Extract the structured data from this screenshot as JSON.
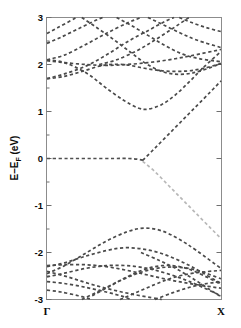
{
  "chart_data": {
    "type": "line",
    "title": "",
    "subtitle": "",
    "xlabel": "",
    "ylabel": "E-E_F (eV)",
    "ylabel_main": "E–E",
    "ylabel_sub": "F",
    "ylabel_unit": " (eV)",
    "xlim": [
      0,
      1
    ],
    "ylim": [
      -3,
      3
    ],
    "grid": false,
    "legend": null,
    "linestyle": "dashed",
    "x_tick_labels": [
      "Γ",
      "X"
    ],
    "x_tick_values": [
      0,
      1
    ],
    "y_tick_labels": [
      "3",
      "2",
      "1",
      "0",
      "-1",
      "-2",
      "-3"
    ],
    "y_tick_values": [
      3,
      2,
      1,
      0,
      -1,
      -2,
      -3
    ],
    "y_minor_ticks": [
      2.5,
      1.5,
      0.5,
      -0.5,
      -1.5,
      -2.5
    ],
    "colors": {
      "band_dark": "#4a4a4a",
      "band_faint": "#b8b8b8",
      "frame": "#8c8c8c",
      "text": "#0a0a0a",
      "background": "#ffffff"
    },
    "series": [
      {
        "name": "flat-zero-band",
        "style": "dashed-dark",
        "points": [
          [
            0.0,
            0.0
          ],
          [
            0.12,
            0.0
          ],
          [
            0.25,
            0.0
          ],
          [
            0.38,
            0.0
          ],
          [
            0.47,
            0.0
          ],
          [
            0.53,
            -0.02
          ],
          [
            0.56,
            -0.05
          ]
        ]
      },
      {
        "name": "conduction-linear-up",
        "style": "dashed-dark",
        "points": [
          [
            0.55,
            -0.04
          ],
          [
            0.62,
            0.22
          ],
          [
            0.7,
            0.52
          ],
          [
            0.78,
            0.82
          ],
          [
            0.86,
            1.12
          ],
          [
            0.94,
            1.42
          ],
          [
            1.0,
            1.65
          ]
        ]
      },
      {
        "name": "valence-linear-down-faint",
        "style": "dashed-faint",
        "points": [
          [
            0.55,
            -0.06
          ],
          [
            0.62,
            -0.28
          ],
          [
            0.7,
            -0.58
          ],
          [
            0.78,
            -0.88
          ],
          [
            0.86,
            -1.18
          ],
          [
            0.94,
            -1.48
          ],
          [
            1.0,
            -1.7
          ]
        ]
      },
      {
        "name": "cb-dip-band",
        "style": "dashed-dark",
        "points": [
          [
            0.0,
            2.1
          ],
          [
            0.08,
            2.06
          ],
          [
            0.16,
            1.95
          ],
          [
            0.25,
            1.76
          ],
          [
            0.34,
            1.5
          ],
          [
            0.44,
            1.24
          ],
          [
            0.52,
            1.08
          ],
          [
            0.58,
            1.05
          ],
          [
            0.66,
            1.15
          ],
          [
            0.74,
            1.36
          ],
          [
            0.82,
            1.64
          ],
          [
            0.9,
            1.94
          ],
          [
            1.0,
            2.28
          ]
        ]
      },
      {
        "name": "cb-band-2",
        "style": "dashed-dark",
        "points": [
          [
            0.0,
            1.7
          ],
          [
            0.09,
            1.74
          ],
          [
            0.2,
            1.85
          ],
          [
            0.32,
            1.98
          ],
          [
            0.44,
            2.0
          ],
          [
            0.56,
            1.92
          ],
          [
            0.68,
            1.86
          ],
          [
            0.8,
            1.86
          ],
          [
            0.9,
            1.92
          ],
          [
            1.0,
            2.02
          ]
        ]
      },
      {
        "name": "cb-band-3",
        "style": "dashed-dark",
        "points": [
          [
            0.0,
            1.7
          ],
          [
            0.1,
            1.8
          ],
          [
            0.22,
            1.96
          ],
          [
            0.34,
            2.2
          ],
          [
            0.46,
            2.48
          ],
          [
            0.58,
            2.72
          ],
          [
            0.68,
            2.92
          ],
          [
            0.73,
            3.0
          ]
        ]
      },
      {
        "name": "cb-band-4",
        "style": "dashed-dark",
        "points": [
          [
            0.0,
            2.1
          ],
          [
            0.1,
            2.2
          ],
          [
            0.22,
            2.42
          ],
          [
            0.34,
            2.66
          ],
          [
            0.46,
            2.88
          ],
          [
            0.54,
            3.0
          ]
        ]
      },
      {
        "name": "cb-band-5",
        "style": "dashed-dark",
        "points": [
          [
            0.0,
            2.45
          ],
          [
            0.08,
            2.58
          ],
          [
            0.18,
            2.76
          ],
          [
            0.28,
            2.94
          ],
          [
            0.32,
            3.0
          ]
        ]
      },
      {
        "name": "cb-band-6",
        "style": "dashed-dark",
        "points": [
          [
            0.0,
            2.66
          ],
          [
            0.06,
            2.78
          ],
          [
            0.14,
            2.94
          ],
          [
            0.17,
            3.0
          ]
        ]
      },
      {
        "name": "cb-band-7-desc",
        "style": "dashed-dark",
        "points": [
          [
            0.2,
            3.0
          ],
          [
            0.28,
            2.8
          ],
          [
            0.38,
            2.54
          ],
          [
            0.48,
            2.26
          ],
          [
            0.56,
            2.04
          ],
          [
            0.64,
            1.88
          ],
          [
            0.72,
            1.8
          ],
          [
            0.8,
            1.8
          ],
          [
            0.88,
            1.86
          ],
          [
            1.0,
            2.02
          ]
        ]
      },
      {
        "name": "cb-band-8-desc",
        "style": "dashed-dark",
        "points": [
          [
            0.4,
            3.0
          ],
          [
            0.48,
            2.84
          ],
          [
            0.58,
            2.62
          ],
          [
            0.68,
            2.4
          ],
          [
            0.78,
            2.22
          ],
          [
            0.88,
            2.12
          ],
          [
            1.0,
            2.06
          ]
        ]
      },
      {
        "name": "cb-band-9-desc",
        "style": "dashed-dark",
        "points": [
          [
            0.58,
            3.0
          ],
          [
            0.66,
            2.86
          ],
          [
            0.76,
            2.68
          ],
          [
            0.86,
            2.52
          ],
          [
            1.0,
            2.36
          ]
        ]
      },
      {
        "name": "cb-band-10-desc",
        "style": "dashed-dark",
        "points": [
          [
            0.76,
            3.0
          ],
          [
            0.84,
            2.88
          ],
          [
            0.92,
            2.78
          ],
          [
            1.0,
            2.7
          ]
        ]
      },
      {
        "name": "cb-band-11-cross",
        "style": "dashed-dark",
        "points": [
          [
            0.3,
            2.0
          ],
          [
            0.4,
            2.1
          ],
          [
            0.52,
            2.3
          ],
          [
            0.62,
            2.52
          ],
          [
            0.72,
            2.76
          ],
          [
            0.8,
            2.96
          ],
          [
            0.82,
            3.0
          ]
        ]
      },
      {
        "name": "cb-band-12-flat",
        "style": "dashed-dark",
        "points": [
          [
            0.0,
            2.08
          ],
          [
            0.1,
            2.04
          ],
          [
            0.22,
            2.0
          ],
          [
            0.34,
            1.98
          ],
          [
            0.46,
            2.0
          ],
          [
            0.58,
            2.04
          ],
          [
            0.7,
            2.1
          ],
          [
            0.82,
            2.18
          ],
          [
            1.0,
            2.32
          ]
        ]
      },
      {
        "name": "vb-band-1-top",
        "style": "dashed-dark",
        "points": [
          [
            0.0,
            -2.45
          ],
          [
            0.1,
            -2.28
          ],
          [
            0.22,
            -2.02
          ],
          [
            0.34,
            -1.76
          ],
          [
            0.46,
            -1.56
          ],
          [
            0.56,
            -1.48
          ],
          [
            0.66,
            -1.54
          ],
          [
            0.76,
            -1.72
          ],
          [
            0.86,
            -1.96
          ],
          [
            1.0,
            -2.34
          ]
        ]
      },
      {
        "name": "vb-band-2",
        "style": "dashed-dark",
        "points": [
          [
            0.0,
            -2.3
          ],
          [
            0.1,
            -2.22
          ],
          [
            0.22,
            -2.08
          ],
          [
            0.34,
            -1.96
          ],
          [
            0.44,
            -1.9
          ],
          [
            0.54,
            -1.92
          ],
          [
            0.64,
            -2.0
          ],
          [
            0.74,
            -2.14
          ],
          [
            0.84,
            -2.32
          ],
          [
            1.0,
            -2.66
          ]
        ]
      },
      {
        "name": "vb-band-3",
        "style": "dashed-dark",
        "points": [
          [
            0.0,
            -2.28
          ],
          [
            0.1,
            -2.26
          ],
          [
            0.22,
            -2.26
          ],
          [
            0.34,
            -2.3
          ],
          [
            0.46,
            -2.38
          ],
          [
            0.58,
            -2.48
          ],
          [
            0.7,
            -2.58
          ],
          [
            0.82,
            -2.66
          ],
          [
            1.0,
            -2.76
          ]
        ]
      },
      {
        "name": "vb-band-4",
        "style": "dashed-dark",
        "points": [
          [
            0.0,
            -2.52
          ],
          [
            0.1,
            -2.44
          ],
          [
            0.22,
            -2.34
          ],
          [
            0.34,
            -2.28
          ],
          [
            0.46,
            -2.28
          ],
          [
            0.58,
            -2.34
          ],
          [
            0.7,
            -2.46
          ],
          [
            0.82,
            -2.62
          ],
          [
            1.0,
            -2.92
          ]
        ]
      },
      {
        "name": "vb-band-5-desc",
        "style": "dashed-dark",
        "points": [
          [
            0.0,
            -2.62
          ],
          [
            0.1,
            -2.66
          ],
          [
            0.22,
            -2.74
          ],
          [
            0.34,
            -2.84
          ],
          [
            0.44,
            -2.94
          ],
          [
            0.48,
            -3.0
          ]
        ]
      },
      {
        "name": "vb-band-6-desc",
        "style": "dashed-dark",
        "points": [
          [
            0.0,
            -2.8
          ],
          [
            0.08,
            -2.84
          ],
          [
            0.18,
            -2.92
          ],
          [
            0.26,
            -3.0
          ]
        ]
      },
      {
        "name": "vb-band-7-asc-from-bottom",
        "style": "dashed-dark",
        "points": [
          [
            0.2,
            -3.0
          ],
          [
            0.3,
            -2.82
          ],
          [
            0.42,
            -2.6
          ],
          [
            0.54,
            -2.42
          ],
          [
            0.66,
            -2.32
          ],
          [
            0.78,
            -2.32
          ],
          [
            0.88,
            -2.4
          ],
          [
            1.0,
            -2.56
          ]
        ]
      },
      {
        "name": "vb-band-8-asc",
        "style": "dashed-dark",
        "points": [
          [
            0.42,
            -3.0
          ],
          [
            0.52,
            -2.84
          ],
          [
            0.62,
            -2.68
          ],
          [
            0.72,
            -2.54
          ],
          [
            0.84,
            -2.44
          ],
          [
            1.0,
            -2.38
          ]
        ]
      },
      {
        "name": "vb-band-9-asc",
        "style": "dashed-dark",
        "points": [
          [
            0.62,
            -3.0
          ],
          [
            0.72,
            -2.86
          ],
          [
            0.82,
            -2.74
          ],
          [
            0.92,
            -2.66
          ],
          [
            1.0,
            -2.62
          ]
        ]
      },
      {
        "name": "vb-band-10-desc-right",
        "style": "dashed-dark",
        "points": [
          [
            0.54,
            -2.0
          ],
          [
            0.64,
            -2.16
          ],
          [
            0.74,
            -2.34
          ],
          [
            0.84,
            -2.56
          ],
          [
            0.94,
            -2.8
          ],
          [
            1.0,
            -2.94
          ]
        ]
      },
      {
        "name": "vb-band-11-cross",
        "style": "dashed-dark",
        "points": [
          [
            0.0,
            -2.4
          ],
          [
            0.12,
            -2.52
          ],
          [
            0.24,
            -2.66
          ],
          [
            0.36,
            -2.78
          ],
          [
            0.48,
            -2.88
          ],
          [
            0.6,
            -2.96
          ],
          [
            0.66,
            -3.0
          ]
        ]
      },
      {
        "name": "vb-band-12-arc",
        "style": "dashed-dark",
        "points": [
          [
            0.26,
            -2.92
          ],
          [
            0.36,
            -2.72
          ],
          [
            0.46,
            -2.52
          ],
          [
            0.56,
            -2.36
          ],
          [
            0.66,
            -2.28
          ],
          [
            0.76,
            -2.3
          ],
          [
            0.86,
            -2.42
          ],
          [
            1.0,
            -2.68
          ]
        ]
      }
    ]
  },
  "axis": {
    "y_label_main": "E–E",
    "y_label_sub": "F",
    "y_label_unit": " (eV)",
    "x_left_label": "Γ",
    "x_right_label": "X"
  }
}
